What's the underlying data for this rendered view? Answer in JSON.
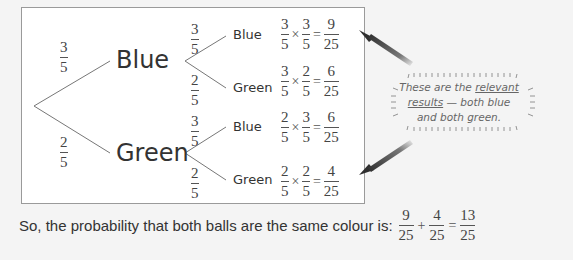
{
  "tree": {
    "first_level": [
      {
        "branch_prob": {
          "num": "3",
          "den": "5"
        },
        "label": "Blue"
      },
      {
        "branch_prob": {
          "num": "2",
          "den": "5"
        },
        "label": "Green"
      }
    ],
    "outcomes": [
      {
        "branch_prob": {
          "num": "3",
          "den": "5"
        },
        "label": "Blue",
        "calc": {
          "a": {
            "num": "3",
            "den": "5"
          },
          "b": {
            "num": "3",
            "den": "5"
          },
          "result": {
            "num": "9",
            "den": "25"
          }
        }
      },
      {
        "branch_prob": {
          "num": "2",
          "den": "5"
        },
        "label": "Green",
        "calc": {
          "a": {
            "num": "3",
            "den": "5"
          },
          "b": {
            "num": "2",
            "den": "5"
          },
          "result": {
            "num": "6",
            "den": "25"
          }
        }
      },
      {
        "branch_prob": {
          "num": "3",
          "den": "5"
        },
        "label": "Blue",
        "calc": {
          "a": {
            "num": "2",
            "den": "5"
          },
          "b": {
            "num": "3",
            "den": "5"
          },
          "result": {
            "num": "6",
            "den": "25"
          }
        }
      },
      {
        "branch_prob": {
          "num": "2",
          "den": "5"
        },
        "label": "Green",
        "calc": {
          "a": {
            "num": "2",
            "den": "5"
          },
          "b": {
            "num": "2",
            "den": "5"
          },
          "result": {
            "num": "4",
            "den": "25"
          }
        }
      }
    ],
    "times": "×",
    "equals": "="
  },
  "callout": {
    "line1_pre": "These are the ",
    "line1_underlined": "relevant",
    "line2_underlined": "results",
    "line2_post": " — both blue",
    "line3": "and both green."
  },
  "summary": {
    "text": "So, the probability that both balls are the same colour is:",
    "terms": [
      {
        "num": "9",
        "den": "25"
      },
      {
        "num": "4",
        "den": "25"
      }
    ],
    "plus": "+",
    "equals": "=",
    "result": {
      "num": "13",
      "den": "25"
    }
  },
  "colors": {
    "arrow": "#3a3a3a",
    "box_border": "#9a9a9a",
    "background": "#f4f4f4"
  }
}
